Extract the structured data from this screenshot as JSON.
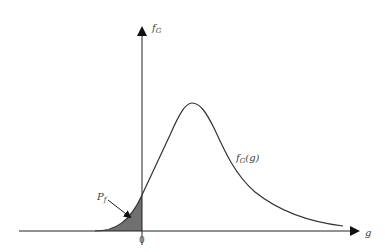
{
  "diagram": {
    "y_axis_label": "f",
    "y_axis_label_sub": "G",
    "x_axis_label": "g",
    "origin_label": "0",
    "curve_label": "f",
    "curve_label_sub": "G",
    "curve_label_arg": "(g)",
    "area_label": "P",
    "area_label_sub": "f",
    "colors": {
      "axis": "#222222",
      "curve": "#333333",
      "shaded_area": "#707070",
      "text": "#444444"
    }
  }
}
